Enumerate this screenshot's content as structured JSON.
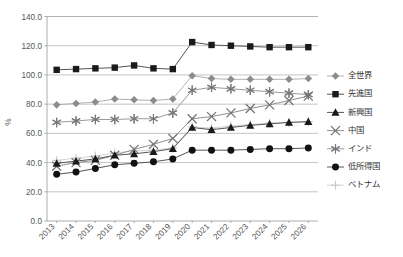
{
  "top_cropped_text": "",
  "chart_data": {
    "type": "line",
    "title": "",
    "xlabel": "",
    "ylabel": "%",
    "ylim": [
      0,
      140
    ],
    "ytick_step": 20,
    "grid": true,
    "legend_position": "right",
    "categories": [
      "2013",
      "2014",
      "2015",
      "2016",
      "2017",
      "2018",
      "2019",
      "2020",
      "2021",
      "2022",
      "2023",
      "2024",
      "2025",
      "2026"
    ],
    "ytick_labels": [
      "140.0",
      "120.0",
      "100.0",
      "80.0",
      "60.0",
      "40.0",
      "20.0",
      "0.0"
    ],
    "series": [
      {
        "name": "全世界",
        "marker": "diamond",
        "color": "#8c8c8c",
        "line_color": "#b0b0b0",
        "values": [
          79.5,
          80.5,
          81.5,
          83.5,
          83.0,
          82.5,
          83.5,
          99.5,
          97.5,
          97.0,
          97.0,
          97.0,
          97.0,
          97.5
        ]
      },
      {
        "name": "先進国",
        "marker": "square",
        "color": "#1a1a1a",
        "line_color": "#555555",
        "values": [
          103.5,
          104.0,
          104.5,
          105.0,
          106.5,
          104.5,
          104.0,
          122.5,
          120.5,
          120.0,
          119.5,
          119.0,
          119.0,
          119.0
        ]
      },
      {
        "name": "新興国",
        "marker": "triangle",
        "color": "#1a1a1a",
        "line_color": "#555555",
        "values": [
          39.5,
          41.0,
          42.5,
          45.0,
          46.0,
          47.5,
          49.5,
          64.0,
          62.5,
          64.0,
          65.5,
          66.5,
          67.5,
          68.0
        ]
      },
      {
        "name": "中国",
        "marker": "x",
        "color": "#707070",
        "line_color": "#909090",
        "values": [
          37.5,
          40.0,
          41.5,
          45.0,
          49.0,
          52.5,
          56.5,
          70.0,
          71.5,
          74.0,
          77.0,
          79.5,
          82.5,
          85.5
        ]
      },
      {
        "name": "インド",
        "marker": "asterisk",
        "color": "#777777",
        "line_color": "#9a9a9a",
        "values": [
          67.5,
          68.5,
          69.5,
          69.5,
          70.0,
          70.0,
          74.0,
          89.5,
          91.5,
          90.5,
          89.5,
          88.5,
          87.5,
          86.5
        ]
      },
      {
        "name": "低所得国",
        "marker": "circle",
        "color": "#111111",
        "line_color": "#555555",
        "values": [
          32.0,
          33.5,
          36.0,
          38.5,
          39.5,
          40.5,
          42.5,
          48.5,
          48.5,
          48.5,
          49.0,
          49.5,
          49.5,
          50.0
        ]
      },
      {
        "name": "ベトナム",
        "marker": "plus",
        "color": "#c9c9c9",
        "line_color": "#d5d5d5",
        "values": [
          41.5,
          43.0,
          44.5,
          46.5,
          48.0,
          48.5,
          50.0,
          64.5,
          63.5,
          65.0,
          66.0,
          67.0,
          67.5,
          68.0
        ]
      }
    ]
  }
}
